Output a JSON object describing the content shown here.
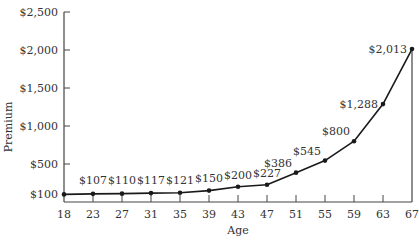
{
  "chart_data": {
    "type": "line",
    "title": "",
    "xlabel": "Age",
    "ylabel": "Premium",
    "x": [
      18,
      23,
      27,
      31,
      35,
      39,
      43,
      47,
      51,
      55,
      59,
      63,
      67
    ],
    "values": [
      100,
      107,
      110,
      117,
      121,
      150,
      200,
      227,
      386,
      545,
      800,
      1288,
      2013
    ],
    "data_labels": [
      "$100",
      "$107",
      "$110",
      "$117",
      "$121",
      "$150",
      "$200",
      "$227",
      "$386",
      "$545",
      "$800",
      "$1,288",
      "$2,013"
    ],
    "ylim": [
      0,
      2500
    ],
    "y_ticks": [
      100,
      500,
      1000,
      1500,
      2000,
      2500
    ],
    "y_tick_labels": [
      "$100",
      "$500",
      "$1,000",
      "$1,500",
      "$2,000",
      "$2,500"
    ],
    "x_tick_labels": [
      "18",
      "23",
      "27",
      "31",
      "35",
      "39",
      "43",
      "47",
      "51",
      "55",
      "59",
      "63",
      "67"
    ],
    "grid": false,
    "legend": "none",
    "colors": {
      "line": "#1a1a1a",
      "axis": "#444444",
      "text": "#333333"
    }
  }
}
